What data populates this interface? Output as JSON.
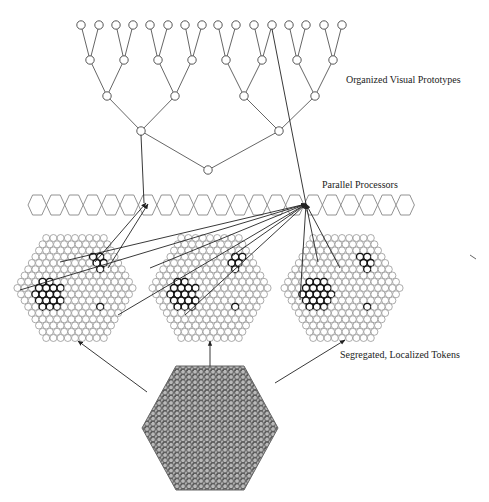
{
  "diagram": {
    "labels": {
      "prototypes": "Organized Visual Prototypes",
      "processors": "Parallel Processors",
      "tokens": "Segregated, Localized Tokens"
    },
    "colors": {
      "stroke": "#555555",
      "dark_stroke": "#111111",
      "arrow": "#222222",
      "texture_fill": "#9a9a9a"
    },
    "tree": {
      "leaves_y": 25,
      "leaves_x": [
        81,
        99,
        116,
        133,
        150,
        168,
        185,
        202,
        218,
        236,
        254,
        272,
        289,
        306,
        324,
        342
      ],
      "level1_y": 60,
      "level1_x": [
        90,
        124,
        158,
        192,
        226,
        262,
        297,
        333
      ],
      "level2_y": 96,
      "level2_x": [
        107,
        175,
        244,
        315
      ],
      "level3_y": 131,
      "level3_x": [
        141,
        279
      ],
      "root": [
        208,
        170
      ]
    },
    "processor_row": {
      "x_start": 28,
      "hex_width": 18.4,
      "count": 21,
      "y_top": 195,
      "y_bottom": 215
    },
    "token_maps": [
      {
        "name": "token-map-left",
        "cx": 75,
        "cy": 288
      },
      {
        "name": "token-map-middle",
        "cx": 210,
        "cy": 288
      },
      {
        "name": "token-map-right",
        "cx": 342,
        "cy": 288
      }
    ],
    "input_image": {
      "cx": 210,
      "cy": 428
    }
  }
}
